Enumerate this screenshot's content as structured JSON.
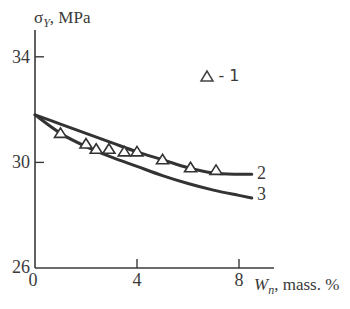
{
  "chart_data": {
    "type": "line",
    "title": "",
    "ylabel": "σY, MPa",
    "ylabel_main": "σ",
    "ylabel_sub": "Y",
    "ylabel_unit": ", MPa",
    "xlabel": "Wn, mass. %",
    "xlabel_main": "W",
    "xlabel_sub": "n",
    "xlabel_unit": ", mass. %",
    "xlim": [
      0,
      9
    ],
    "ylim": [
      26,
      35
    ],
    "xticks": [
      0,
      4,
      8
    ],
    "yticks": [
      26,
      30,
      34
    ],
    "xtick_labels": [
      "0",
      "4",
      "8"
    ],
    "ytick_labels": [
      "26",
      "30",
      "34"
    ],
    "grid": false,
    "legend": {
      "position": "upper right",
      "entries": [
        {
          "marker": "△",
          "label": "- 1"
        }
      ]
    },
    "series": [
      {
        "name": "1",
        "type": "scatter",
        "marker": "triangle-open",
        "x": [
          1.0,
          2.0,
          2.4,
          2.9,
          3.5,
          4.0,
          5.0,
          6.1,
          7.1
        ],
        "y": [
          31.1,
          30.7,
          30.5,
          30.5,
          30.4,
          30.4,
          30.1,
          29.8,
          29.7
        ]
      },
      {
        "name": "2",
        "type": "line",
        "x": [
          0,
          1,
          2,
          3,
          4,
          5,
          6,
          7,
          8,
          8.5
        ],
        "y": [
          31.8,
          31.45,
          31.1,
          30.75,
          30.4,
          30.1,
          29.8,
          29.6,
          29.55,
          29.55
        ]
      },
      {
        "name": "3",
        "type": "line",
        "x": [
          0,
          1,
          2,
          3,
          4,
          5,
          6,
          7,
          8,
          8.5
        ],
        "y": [
          31.8,
          31.1,
          30.6,
          30.2,
          29.85,
          29.5,
          29.2,
          28.95,
          28.75,
          28.65
        ]
      }
    ],
    "curve_labels": [
      {
        "text": "2",
        "series": "2"
      },
      {
        "text": "3",
        "series": "3"
      }
    ]
  }
}
